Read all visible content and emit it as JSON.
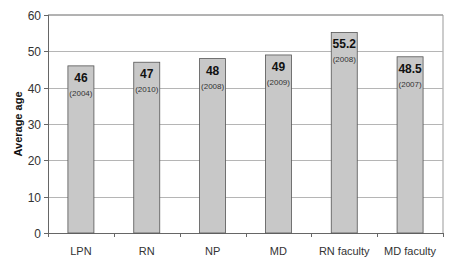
{
  "chart_data": {
    "type": "bar",
    "title": "",
    "xlabel": "",
    "ylabel": "Average age",
    "ylim": [
      0,
      60
    ],
    "yticks": [
      0,
      10,
      20,
      30,
      40,
      50,
      60
    ],
    "grid": true,
    "legend": null,
    "categories": [
      "LPN",
      "RN",
      "NP",
      "MD",
      "RN faculty",
      "MD faculty"
    ],
    "values": [
      46,
      47,
      48,
      49,
      55.2,
      48.5
    ],
    "value_labels": [
      "46",
      "47",
      "48",
      "49",
      "55.2",
      "48.5"
    ],
    "year_annotations": [
      "(2004)",
      "(2010)",
      "(2008)",
      "(2009)",
      "(2008)",
      "(2007)"
    ],
    "colors": {
      "bar_fill": "#c8c8c8",
      "bar_edge": "#555555",
      "grid": "#b5b5b5",
      "axis": "#666666"
    }
  }
}
